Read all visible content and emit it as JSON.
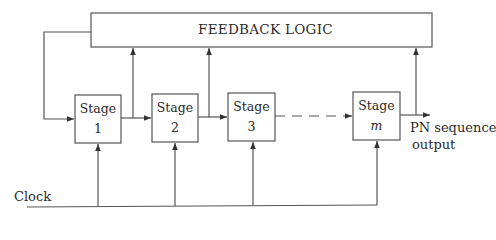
{
  "diagram": {
    "feedback_logic": {
      "label": "FEEDBACK LOGIC"
    },
    "stages": [
      {
        "title": "Stage",
        "index": "1"
      },
      {
        "title": "Stage",
        "index": "2"
      },
      {
        "title": "Stage",
        "index": "3"
      },
      {
        "title": "Stage",
        "index": "m"
      }
    ],
    "output_label": {
      "line1": "PN sequence",
      "line2": "output"
    },
    "clock_label": "Clock"
  }
}
